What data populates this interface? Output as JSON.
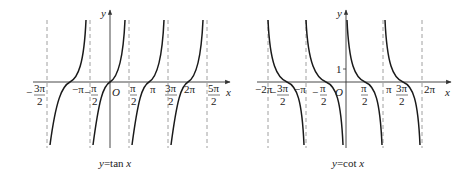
{
  "figures": [
    {
      "id": "tan",
      "caption": "y=tan x",
      "caption_parts": {
        "y": "y",
        "eq": "=tan ",
        "x": "x"
      },
      "axis_labels": {
        "x": "x",
        "y": "y",
        "origin": "O"
      },
      "tick_labels": [
        {
          "text_num": "3π",
          "text_den": "2",
          "sign": "−",
          "pos": "-3pi/2"
        },
        {
          "text": "−π",
          "pos": "-pi"
        },
        {
          "text_num": "π",
          "text_den": "2",
          "sign": "−",
          "pos": "-pi/2"
        },
        {
          "text_num": "π",
          "text_den": "2",
          "pos": "pi/2"
        },
        {
          "text": "π",
          "pos": "pi"
        },
        {
          "text_num": "3π",
          "text_den": "2",
          "pos": "3pi/2"
        },
        {
          "text": "2π",
          "pos": "2pi"
        },
        {
          "text_num": "5π",
          "text_den": "2",
          "pos": "5pi/2"
        }
      ],
      "asymptotes": [
        "-3π/2",
        "-π/2",
        "π/2",
        "3π/2",
        "5π/2"
      ]
    },
    {
      "id": "cot",
      "caption": "y=cot x",
      "caption_parts": {
        "y": "y",
        "eq": "=cot ",
        "x": "x"
      },
      "axis_labels": {
        "x": "x",
        "y": "y",
        "origin": "O",
        "one": "1"
      },
      "tick_labels": [
        {
          "text": "−2π",
          "pos": "-2pi"
        },
        {
          "text_num": "3π",
          "text_den": "2",
          "sign": "−",
          "pos": "-3pi/2"
        },
        {
          "text": "−π",
          "pos": "-pi"
        },
        {
          "text_num": "π",
          "text_den": "2",
          "sign": "−",
          "pos": "-pi/2"
        },
        {
          "text_num": "π",
          "text_den": "2",
          "pos": "pi/2"
        },
        {
          "text": "π",
          "pos": "pi"
        },
        {
          "text_num": "3π",
          "text_den": "2",
          "pos": "3pi/2"
        },
        {
          "text": "2π",
          "pos": "2pi"
        }
      ],
      "asymptotes": [
        "-2π",
        "-π",
        "0",
        "π",
        "2π"
      ]
    }
  ],
  "colors": {
    "curve": "#1a1a1a",
    "axis": "#333333",
    "dashed": "#888888"
  }
}
